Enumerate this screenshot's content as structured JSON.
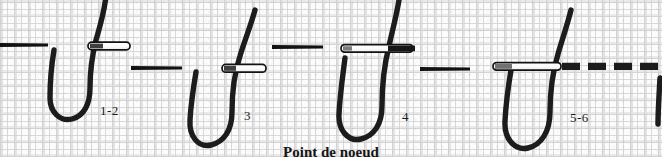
{
  "figure": {
    "caption": "Point de noeud",
    "background": "woven-fabric-texture",
    "colors": {
      "thread": "#1a1a1a",
      "needle_body": "#ffffff",
      "needle_outline": "#111111",
      "fabric_light": "#fcfcfc",
      "fabric_weave": "#dcdcdc",
      "label_text": "#1a1a1a"
    },
    "steps": [
      {
        "id": "step-1-2",
        "label": "1-2",
        "label_x": 100,
        "label_y": 110
      },
      {
        "id": "step-3",
        "label": "3",
        "label_x": 244,
        "label_y": 115
      },
      {
        "id": "step-4",
        "label": "4",
        "label_x": 402,
        "label_y": 116
      },
      {
        "id": "step-5-6",
        "label": "5-6",
        "label_x": 570,
        "label_y": 117
      }
    ],
    "legend": {
      "thread_loop": "thread-loop",
      "needle": "sewing-needle",
      "stitch_dash": "completed-stitch-dash"
    }
  }
}
